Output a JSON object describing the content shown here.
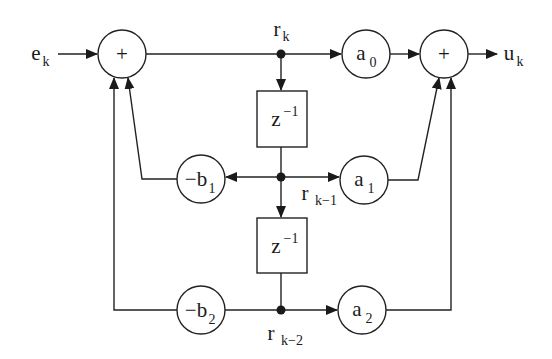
{
  "diagram": {
    "colors": {
      "stroke": "#222222",
      "background": "#ffffff",
      "text": "#1a1a1a"
    },
    "input": {
      "label": "e",
      "sub": "k"
    },
    "output": {
      "label": "u",
      "sub": "k"
    },
    "signals": [
      {
        "id": "r_k",
        "label": "r",
        "sub": "k"
      },
      {
        "id": "r_k1",
        "label": "r",
        "sub": "k−1"
      },
      {
        "id": "r_k2",
        "label": "r",
        "sub": "k−2"
      }
    ],
    "summers": [
      {
        "id": "sum_in",
        "symbol": "+"
      },
      {
        "id": "sum_out",
        "symbol": "+"
      }
    ],
    "delays": [
      {
        "id": "delay1",
        "label": "z",
        "sup": "−1"
      },
      {
        "id": "delay2",
        "label": "z",
        "sup": "−1"
      }
    ],
    "gains": [
      {
        "id": "a0",
        "label": "a",
        "sub": "0"
      },
      {
        "id": "a1",
        "label": "a",
        "sub": "1"
      },
      {
        "id": "a2",
        "label": "a",
        "sub": "2"
      },
      {
        "id": "b1",
        "label": "−b",
        "sub": "1"
      },
      {
        "id": "b2",
        "label": "−b",
        "sub": "2"
      }
    ],
    "connections": [
      {
        "from": "e_k",
        "to": "sum_in"
      },
      {
        "from": "sum_in",
        "to": "r_k"
      },
      {
        "from": "r_k",
        "to": "a0"
      },
      {
        "from": "a0",
        "to": "sum_out"
      },
      {
        "from": "sum_out",
        "to": "u_k"
      },
      {
        "from": "r_k",
        "to": "delay1"
      },
      {
        "from": "delay1",
        "to": "r_k1"
      },
      {
        "from": "r_k1",
        "to": "b1"
      },
      {
        "from": "r_k1",
        "to": "a1"
      },
      {
        "from": "r_k1",
        "to": "delay2"
      },
      {
        "from": "delay2",
        "to": "r_k2"
      },
      {
        "from": "r_k2",
        "to": "b2"
      },
      {
        "from": "r_k2",
        "to": "a2"
      },
      {
        "from": "b1",
        "to": "sum_in"
      },
      {
        "from": "b2",
        "to": "sum_in"
      },
      {
        "from": "a1",
        "to": "sum_out"
      },
      {
        "from": "a2",
        "to": "sum_out"
      }
    ]
  }
}
